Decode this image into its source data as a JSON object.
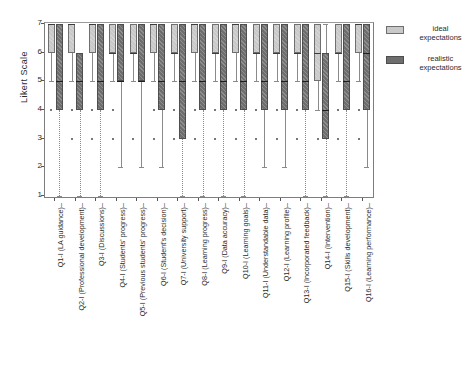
{
  "chart_data": {
    "type": "boxplot",
    "title": "",
    "xlabel": "",
    "ylabel": "Likert Scale",
    "ylim": [
      1,
      7
    ],
    "yticks": [
      1,
      2,
      3,
      4,
      5,
      6,
      7
    ],
    "grid": false,
    "legend_position": "right",
    "colors": {
      "ideal": "#c9c9c9",
      "realistic": "#6e6e6e",
      "frame": "#7d7d7d"
    },
    "legend": [
      {
        "name": "ideal expectations",
        "line1": "ideal",
        "line2": "expectations",
        "color": "#c9c9c9"
      },
      {
        "name": "realistic expectations",
        "line1": "realistic",
        "line2": "expectations",
        "color": "#6e6e6e"
      }
    ],
    "categories": [
      "Q1-I (LA guidance)",
      "Q2-I (Professional development)",
      "Q3-I (Discussions)",
      "Q4-I (Students' progress)",
      "Q5-I (Previous students' progress)",
      "Q6-I (Student's decision)",
      "Q7-I (University support)",
      "Q8-I (Learning progress)",
      "Q9-I (Data accuracy)",
      "Q10-I (Learning goals)",
      "Q11-I (Understandable data)",
      "Q12-I (Learning profile)",
      "Q13-I (Incorporated feedback)",
      "Q14-I (Intervention)",
      "Q15-I (Skills development)",
      "Q16-I (Learning performance)"
    ],
    "series": [
      {
        "name": "ideal expectations",
        "color": "#c9c9c9",
        "boxes": [
          {
            "q1": 6,
            "median": 7,
            "q3": 7,
            "lower": 5,
            "upper": 7,
            "outliers": [
              4
            ]
          },
          {
            "q1": 6,
            "median": 7,
            "q3": 7,
            "lower": 5,
            "upper": 7,
            "outliers": [
              4,
              3
            ]
          },
          {
            "q1": 6,
            "median": 7,
            "q3": 7,
            "lower": 5,
            "upper": 7,
            "outliers": [
              4,
              3
            ]
          },
          {
            "q1": 6,
            "median": 6,
            "q3": 7,
            "lower": 5,
            "upper": 7,
            "outliers": [
              4,
              3
            ]
          },
          {
            "q1": 6,
            "median": 6,
            "q3": 7,
            "lower": 5,
            "upper": 7,
            "outliers": [
              3
            ]
          },
          {
            "q1": 6,
            "median": 7,
            "q3": 7,
            "lower": 5,
            "upper": 7,
            "outliers": [
              4,
              3
            ]
          },
          {
            "q1": 6,
            "median": 6,
            "q3": 7,
            "lower": 5,
            "upper": 7,
            "outliers": [
              4,
              3
            ]
          },
          {
            "q1": 6,
            "median": 7,
            "q3": 7,
            "lower": 5,
            "upper": 7,
            "outliers": [
              4,
              3
            ]
          },
          {
            "q1": 6,
            "median": 6,
            "q3": 7,
            "lower": 5,
            "upper": 7,
            "outliers": [
              4,
              3
            ]
          },
          {
            "q1": 6,
            "median": 7,
            "q3": 7,
            "lower": 5,
            "upper": 7,
            "outliers": [
              4,
              3
            ]
          },
          {
            "q1": 6,
            "median": 6,
            "q3": 7,
            "lower": 5,
            "upper": 7,
            "outliers": [
              4,
              3
            ]
          },
          {
            "q1": 6,
            "median": 6,
            "q3": 7,
            "lower": 5,
            "upper": 7,
            "outliers": [
              4,
              3
            ]
          },
          {
            "q1": 6,
            "median": 6,
            "q3": 7,
            "lower": 5,
            "upper": 7,
            "outliers": [
              4,
              3
            ]
          },
          {
            "q1": 5,
            "median": 6,
            "q3": 7,
            "lower": 4,
            "upper": 7,
            "outliers": [
              3
            ]
          },
          {
            "q1": 6,
            "median": 6,
            "q3": 7,
            "lower": 5,
            "upper": 7,
            "outliers": [
              4,
              3
            ]
          },
          {
            "q1": 6,
            "median": 7,
            "q3": 7,
            "lower": 5,
            "upper": 7,
            "outliers": [
              4,
              3
            ]
          }
        ]
      },
      {
        "name": "realistic expectations",
        "color": "#6e6e6e",
        "boxes": [
          {
            "q1": 4,
            "median": 5,
            "q3": 7,
            "lower": 1,
            "upper": 7,
            "outliers": []
          },
          {
            "q1": 4,
            "median": 5,
            "q3": 6,
            "lower": 1,
            "upper": 6,
            "outliers": []
          },
          {
            "q1": 4,
            "median": 5,
            "q3": 7,
            "lower": 1,
            "upper": 7,
            "outliers": []
          },
          {
            "q1": 5,
            "median": 5,
            "q3": 7,
            "lower": 2,
            "upper": 7,
            "outliers": []
          },
          {
            "q1": 5,
            "median": 5,
            "q3": 7,
            "lower": 2,
            "upper": 7,
            "outliers": []
          },
          {
            "q1": 4,
            "median": 5,
            "q3": 7,
            "lower": 2,
            "upper": 7,
            "outliers": []
          },
          {
            "q1": 3,
            "median": 5,
            "q3": 7,
            "lower": 1,
            "upper": 7,
            "outliers": []
          },
          {
            "q1": 4,
            "median": 5,
            "q3": 7,
            "lower": 1,
            "upper": 7,
            "outliers": []
          },
          {
            "q1": 4,
            "median": 5,
            "q3": 7,
            "lower": 1,
            "upper": 7,
            "outliers": []
          },
          {
            "q1": 4,
            "median": 5,
            "q3": 7,
            "lower": 1,
            "upper": 7,
            "outliers": []
          },
          {
            "q1": 4,
            "median": 5,
            "q3": 7,
            "lower": 2,
            "upper": 7,
            "outliers": []
          },
          {
            "q1": 4,
            "median": 5,
            "q3": 7,
            "lower": 2,
            "upper": 7,
            "outliers": []
          },
          {
            "q1": 4,
            "median": 5,
            "q3": 7,
            "lower": 1,
            "upper": 7,
            "outliers": []
          },
          {
            "q1": 3,
            "median": 4,
            "q3": 6,
            "lower": 1,
            "upper": 7,
            "outliers": []
          },
          {
            "q1": 4,
            "median": 5,
            "q3": 7,
            "lower": 1,
            "upper": 7,
            "outliers": []
          },
          {
            "q1": 4,
            "median": 6,
            "q3": 7,
            "lower": 2,
            "upper": 7,
            "outliers": []
          }
        ]
      }
    ]
  }
}
